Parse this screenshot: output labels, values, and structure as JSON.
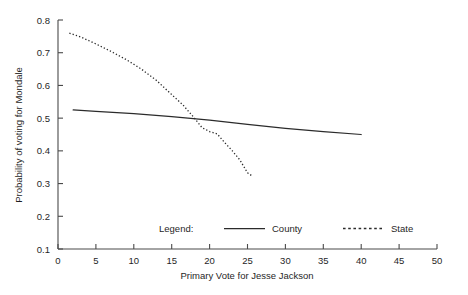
{
  "chart_data": {
    "type": "line",
    "title": "",
    "xlabel": "Primary Vote for Jesse Jackson",
    "ylabel": "Probability of voting for Mondale",
    "xlim": [
      0,
      50
    ],
    "ylim": [
      0.1,
      0.8
    ],
    "grid": false,
    "legend_position": "bottom-center",
    "legend_title": "Legend:",
    "xticks": [
      0,
      5,
      10,
      15,
      20,
      25,
      30,
      35,
      40,
      45,
      50
    ],
    "xtick_labels": [
      "0",
      "5",
      "10",
      "15",
      "20",
      "25",
      "30",
      "35",
      "40",
      "45",
      "50"
    ],
    "yticks": [
      0.1,
      0.2,
      0.3,
      0.4,
      0.5,
      0.6,
      0.7,
      0.8
    ],
    "ytick_labels": [
      "0.1",
      "0.2",
      "0.3",
      "0.4",
      "0.5",
      "0.6",
      "0.7",
      "0.8"
    ],
    "series": [
      {
        "name": "County",
        "style": "solid",
        "color": "#2b2b2b",
        "x": [
          2,
          5,
          10,
          15,
          20,
          25,
          30,
          35,
          40
        ],
        "values": [
          0.525,
          0.521,
          0.514,
          0.505,
          0.494,
          0.481,
          0.469,
          0.459,
          0.45
        ]
      },
      {
        "name": "State",
        "style": "dotted",
        "color": "#2b2b2b",
        "x": [
          1.5,
          3,
          5,
          7,
          9,
          11,
          13,
          15,
          16.5,
          18,
          19,
          20,
          21,
          22,
          23,
          24,
          25,
          25.5
        ],
        "values": [
          0.76,
          0.748,
          0.727,
          0.704,
          0.679,
          0.65,
          0.615,
          0.572,
          0.54,
          0.5,
          0.471,
          0.459,
          0.452,
          0.425,
          0.4,
          0.372,
          0.333,
          0.325
        ]
      }
    ]
  },
  "axes": {
    "x_title": "Primary Vote for Jesse Jackson",
    "y_title": "Probability of voting for Mondale"
  },
  "legend": {
    "title": "Legend:",
    "entries": [
      {
        "label": "County",
        "style": "solid"
      },
      {
        "label": "State",
        "style": "dotted"
      }
    ]
  }
}
